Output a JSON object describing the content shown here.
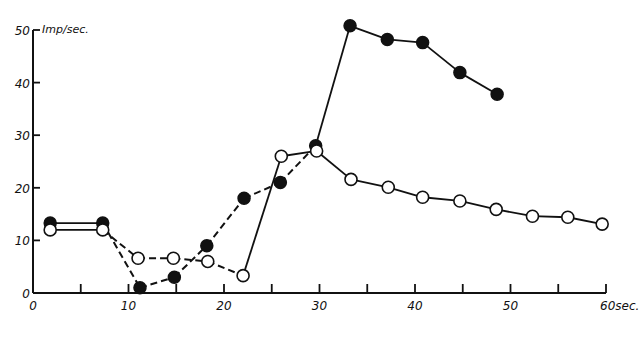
{
  "chart_data": {
    "type": "line",
    "title": "",
    "xlabel": "sec.",
    "ylabel": "Imp/sec.",
    "xlim": [
      0,
      60
    ],
    "ylim": [
      0,
      50
    ],
    "x_ticks": [
      0,
      10,
      20,
      30,
      40,
      50,
      60
    ],
    "x_tick_labels": [
      "0",
      "10",
      "20",
      "30",
      "40",
      "50",
      "60sec."
    ],
    "x_minor_ticks": [
      5,
      15,
      25,
      35,
      45,
      55
    ],
    "y_ticks": [
      0,
      10,
      20,
      30,
      40,
      50
    ],
    "y_tick_labels": [
      "0",
      "10",
      "20",
      "30",
      "40",
      "50"
    ],
    "grid": false,
    "legend": null,
    "series": [
      {
        "name": "filled circles",
        "marker": "filled-circle",
        "x": [
          1.8,
          7.3,
          11.2,
          14.8,
          18.2,
          22.1,
          25.9,
          29.6,
          33.2,
          37.1,
          40.8,
          44.7,
          48.6
        ],
        "values": [
          13.3,
          13.3,
          1,
          3,
          9,
          18,
          21,
          28,
          50.8,
          48.2,
          47.6,
          41.9,
          37.8
        ],
        "segment_styles": [
          "solid",
          "dashed",
          "dashed",
          "dashed",
          "dashed",
          "dashed",
          "dashed",
          "solid",
          "solid",
          "solid",
          "solid",
          "solid"
        ]
      },
      {
        "name": "open circles",
        "marker": "open-circle",
        "x": [
          1.8,
          7.3,
          11,
          14.7,
          18.3,
          22,
          26,
          29.7,
          33.3,
          37.2,
          40.8,
          44.7,
          48.5,
          52.3,
          56,
          59.6
        ],
        "values": [
          12,
          12,
          6.6,
          6.6,
          6,
          3.3,
          26,
          27,
          21.6,
          20.1,
          18.2,
          17.5,
          15.9,
          14.6,
          14.4,
          13.1
        ],
        "segment_styles": [
          "solid",
          "dashed",
          "dashed",
          "dashed",
          "dashed",
          "solid",
          "solid",
          "solid",
          "solid",
          "solid",
          "solid",
          "solid",
          "solid",
          "solid",
          "solid"
        ]
      }
    ]
  }
}
